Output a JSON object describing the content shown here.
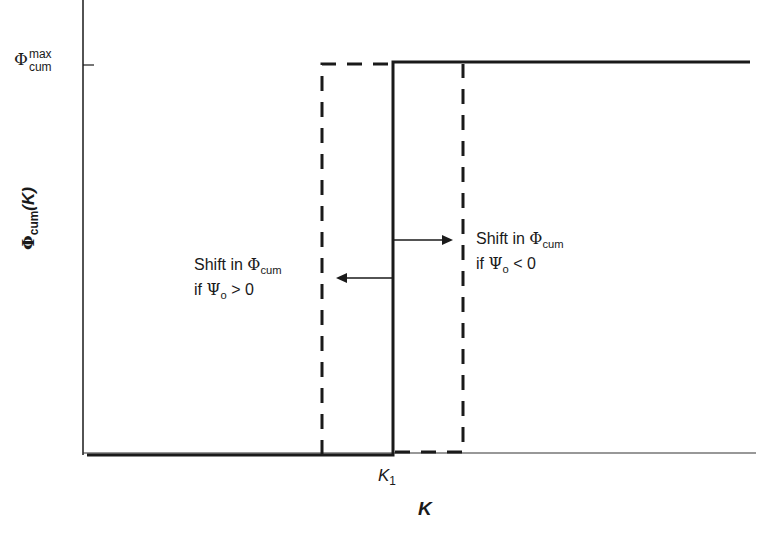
{
  "diagram": {
    "y_axis": {
      "label_symbol": "Φ",
      "label_sub": "cum",
      "label_arg": "(K)",
      "max_tick": {
        "symbol": "Φ",
        "sup": "max",
        "sub": "cum"
      }
    },
    "x_axis": {
      "label": "K",
      "tick_label_main": "K",
      "tick_label_sub": "1"
    },
    "annotations": {
      "left": {
        "line1_text": "Shift in ",
        "line1_symbol": "Φ",
        "line1_sub": "cum",
        "line2_text": "if ",
        "line2_symbol": "Ψ",
        "line2_sub": "o",
        "line2_tail": " > 0"
      },
      "right": {
        "line1_text": "Shift in ",
        "line1_symbol": "Φ",
        "line1_sub": "cum",
        "line2_text": "if ",
        "line2_symbol": "Ψ",
        "line2_sub": "o",
        "line2_tail": " < 0"
      }
    },
    "curves": [
      {
        "name": "step at K1",
        "style": "solid"
      },
      {
        "name": "shifted left (Ψo > 0)",
        "style": "dashed"
      },
      {
        "name": "shifted right (Ψo < 0)",
        "style": "dashed"
      }
    ],
    "colors": {
      "line": "#1a1a1a",
      "background": "#ffffff"
    }
  }
}
